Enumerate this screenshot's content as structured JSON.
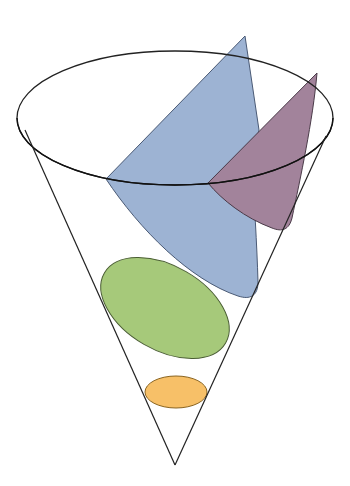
{
  "diagram": {
    "cone": {
      "stroke": "#222222"
    },
    "sections": [
      {
        "name": "circle",
        "fill": "#f7c068"
      },
      {
        "name": "ellipse",
        "fill": "#a6c97a"
      },
      {
        "name": "parabola",
        "fill": "#9db3d3"
      },
      {
        "name": "hyperbola",
        "fill": "#a2839b"
      }
    ]
  }
}
